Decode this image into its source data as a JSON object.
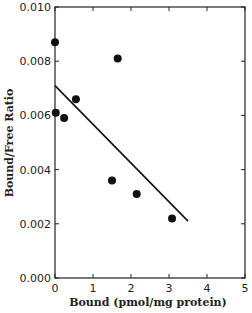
{
  "chart_data": {
    "type": "scatter",
    "title": "",
    "xlabel": "Bound (pmol/mg protein)",
    "ylabel": "Bound/Free Ratio",
    "xlim": [
      0,
      5
    ],
    "ylim": [
      0.0,
      0.01
    ],
    "x_ticks": [
      "0",
      "1",
      "2",
      "3",
      "4",
      "5"
    ],
    "y_ticks": [
      "0.000",
      "0.002",
      "0.004",
      "0.006",
      "0.008",
      "0.010"
    ],
    "grid": false,
    "legend": null,
    "series": [
      {
        "name": "data points",
        "x": [
          0.0,
          1.65,
          0.02,
          0.24,
          0.55,
          1.5,
          2.15,
          3.08
        ],
        "y": [
          0.0087,
          0.0081,
          0.0061,
          0.0059,
          0.0066,
          0.0036,
          0.0031,
          0.0022
        ]
      },
      {
        "name": "linear fit",
        "type": "line",
        "x": [
          0.0,
          3.5
        ],
        "y": [
          0.0071,
          0.0021
        ]
      }
    ]
  }
}
